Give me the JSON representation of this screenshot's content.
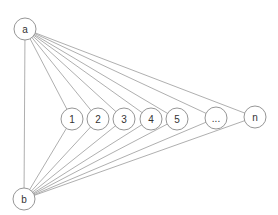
{
  "diagram": {
    "type": "graph",
    "source": {
      "id": "a",
      "label": "a",
      "x": 25,
      "y": 29
    },
    "sink": {
      "id": "b",
      "label": "b",
      "x": 24,
      "y": 199
    },
    "middle_nodes": [
      {
        "id": "1",
        "label": "1",
        "x": 72,
        "y": 119
      },
      {
        "id": "2",
        "label": "2",
        "x": 98,
        "y": 119
      },
      {
        "id": "3",
        "label": "3",
        "x": 124,
        "y": 119
      },
      {
        "id": "4",
        "label": "4",
        "x": 151,
        "y": 119
      },
      {
        "id": "5",
        "label": "5",
        "x": 177,
        "y": 119
      },
      {
        "id": "ellipsis",
        "label": "...",
        "x": 216,
        "y": 118
      },
      {
        "id": "n",
        "label": "n",
        "x": 255,
        "y": 117
      }
    ],
    "node_radius": 11,
    "edges": "a connects to b and to every middle node; b connects to every middle node",
    "colors": {
      "stroke": "#8a8a8a",
      "edge": "#9a9a9a",
      "text": "#333333",
      "background": "#ffffff"
    }
  }
}
